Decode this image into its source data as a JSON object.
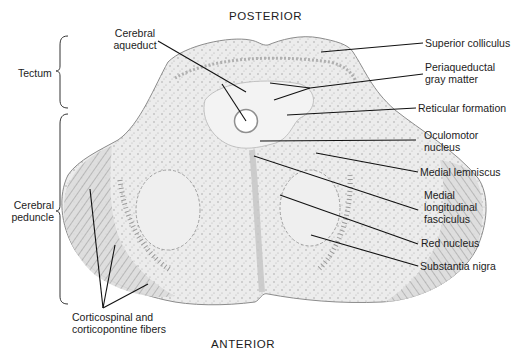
{
  "diagram": {
    "title_top": "POSTERIOR",
    "title_bottom": "ANTERIOR",
    "colors": {
      "tissue_fill": "#e9e9e9",
      "tissue_light": "#f1f1f1",
      "fiber_dark": "#9a9a9a",
      "outline": "#8c8c8c",
      "leader_line": "#111111",
      "background": "#ffffff"
    },
    "left_labels": {
      "tectum": "Tectum",
      "cerebral_peduncle_line1": "Cerebral",
      "cerebral_peduncle_line2": "peduncle",
      "corticospinal_line1": "Corticospinal and",
      "corticospinal_line2": "corticopontine fibers",
      "cerebral_aqueduct_line1": "Cerebral",
      "cerebral_aqueduct_line2": "aqueduct"
    },
    "right_labels": [
      {
        "id": "superior-colliculus",
        "lines": [
          "Superior colliculus"
        ]
      },
      {
        "id": "periaqueductal-gray-matter",
        "lines": [
          "Periaqueductal",
          "gray matter"
        ]
      },
      {
        "id": "reticular-formation",
        "lines": [
          "Reticular formation"
        ]
      },
      {
        "id": "oculomotor-nucleus",
        "lines": [
          "Oculomotor",
          "nucleus"
        ]
      },
      {
        "id": "medial-lemniscus",
        "lines": [
          "Medial lemniscus"
        ]
      },
      {
        "id": "medial-longitudinal-fasciculus",
        "lines": [
          "Medial",
          "longitudinal",
          "fasciculus"
        ]
      },
      {
        "id": "red-nucleus",
        "lines": [
          "Red nucleus"
        ]
      },
      {
        "id": "substantia-nigra",
        "lines": [
          "Substantia nigra"
        ]
      }
    ]
  }
}
